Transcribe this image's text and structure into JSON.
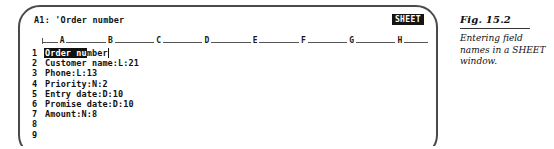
{
  "window": {
    "status_line": "A1: 'Order number",
    "mode_badge": "SHEET"
  },
  "grid": {
    "columns": [
      "A",
      "B",
      "C",
      "D",
      "E",
      "F",
      "G",
      "H"
    ],
    "rows": [
      {
        "number": "1",
        "text": "Order number",
        "selected": true
      },
      {
        "number": "2",
        "text": "Customer name:L:21",
        "selected": false
      },
      {
        "number": "3",
        "text": "Phone:L:13",
        "selected": false
      },
      {
        "number": "4",
        "text": "Priority:N:2",
        "selected": false
      },
      {
        "number": "5",
        "text": "Entry date:D:10",
        "selected": false
      },
      {
        "number": "6",
        "text": "Promise date:D:10",
        "selected": false
      },
      {
        "number": "7",
        "text": "Amount:N:8",
        "selected": false
      },
      {
        "number": "8",
        "text": "",
        "selected": false
      },
      {
        "number": "9",
        "text": "",
        "selected": false
      }
    ]
  },
  "figure": {
    "label": "Fig. 15.2",
    "caption": "Entering field names in a SHEET window."
  },
  "colors": {
    "ink": "#111111",
    "frame": "#4a4a4a",
    "paper": "#ffffff",
    "highlight_bg": "#141414",
    "highlight_fg": "#ffffff"
  }
}
